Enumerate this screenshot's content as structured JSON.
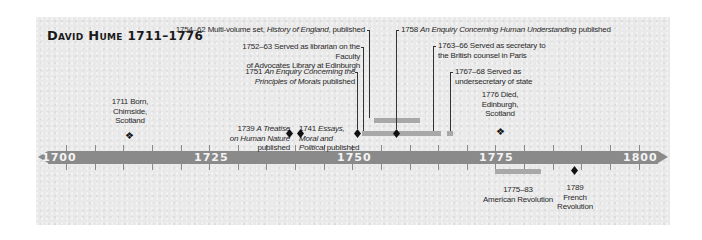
{
  "title": {
    "name": "David Hume",
    "years": "1711–1776"
  },
  "axis": {
    "labels": [
      {
        "text": "1700",
        "x": 54
      },
      {
        "text": "1725",
        "x": 194
      },
      {
        "text": "1750",
        "x": 337
      },
      {
        "text": "1775",
        "x": 479
      },
      {
        "text": "1800",
        "x": 623
      }
    ]
  },
  "events": {
    "born": {
      "year": "1711",
      "line1": "1711 Born,",
      "line2": "Chirnside,",
      "line3": "Scotland"
    },
    "treatise": {
      "year": "1739",
      "prefix": "1739 ",
      "italic1": "A Treatise",
      "italic2": "on Human Nature",
      "suffix": "published"
    },
    "essays": {
      "year": "1741",
      "prefix": "1741 ",
      "italic1": "Essays,",
      "italic2": "Moral and",
      "italic3": "Political",
      "suffix": " published"
    },
    "morals": {
      "year": "1751",
      "prefix": "1751 ",
      "italic1": "An Enquiry Concerning the",
      "italic2": "Principles of Morals",
      "suffix": " published"
    },
    "librarian": {
      "years": "1752–63",
      "line1": "1752–63 Served as librarian on the Faculty",
      "line2": "of Advocates Library at Edinburgh"
    },
    "history": {
      "years": "1754–62",
      "prefix": "1754–62 Multi-volume set, ",
      "italic": "History of England",
      "suffix": ", published"
    },
    "understanding": {
      "year": "1758",
      "prefix": "1758 ",
      "italic": "An Enquiry Concerning Human Understanding",
      "suffix": " published"
    },
    "secretary": {
      "years": "1763–66",
      "line1": "1763–66 Served as secretary to",
      "line2": "the British counsel in Paris"
    },
    "undersecretary": {
      "years": "1767–68",
      "line1": "1767–68 Served as",
      "line2": "undersecretary of state"
    },
    "died": {
      "year": "1776",
      "line1": "1776 Died,",
      "line2": "Edinburgh,",
      "line3": "Scotland"
    },
    "american": {
      "years": "1775–83",
      "line1": "1775–83",
      "line2": "American Revolution"
    },
    "french": {
      "year": "1789",
      "line1": "1789",
      "line2": "French",
      "line3": "Revolution"
    }
  },
  "colors": {
    "axis": "#8a8a8a",
    "bar": "#a8a8a8",
    "marker": "#111111",
    "paper": "#e9e9e9"
  }
}
